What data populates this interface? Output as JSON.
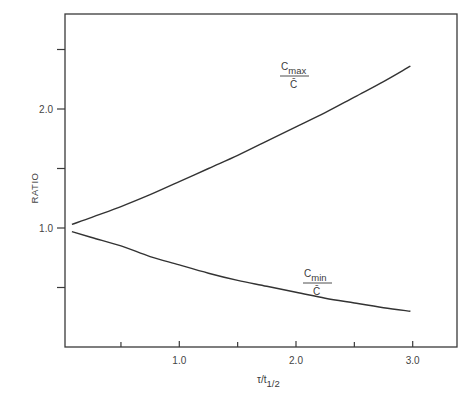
{
  "chart_data": {
    "type": "line",
    "title": "",
    "xlabel": "τ/t1/2",
    "xlabel_main": "τ/t",
    "xlabel_sub": "1/2",
    "ylabel": "RATIO",
    "xlim": [
      0,
      3.4
    ],
    "ylim": [
      0,
      2.8
    ],
    "x_ticks": [
      0.5,
      1.0,
      1.5,
      2.0,
      2.5,
      3.0
    ],
    "x_tick_labels": {
      "1.0": "1.0",
      "2.0": "2.0",
      "3.0": "3.0"
    },
    "y_ticks": [
      0.5,
      1.0,
      1.5,
      2.0,
      2.5
    ],
    "y_tick_labels": {
      "1.0": "1.0",
      "2.0": "2.0"
    },
    "grid": false,
    "legend": "inline curve labels",
    "x": [
      0.08,
      0.25,
      0.5,
      0.75,
      1.0,
      1.25,
      1.5,
      1.75,
      2.0,
      2.25,
      2.5,
      2.75,
      2.98
    ],
    "series": [
      {
        "name": "Cmax/C̄",
        "label_main": "C",
        "label_sub": "max",
        "label_den": "C̄",
        "values": [
          1.03,
          1.09,
          1.18,
          1.28,
          1.39,
          1.5,
          1.61,
          1.73,
          1.85,
          1.97,
          2.1,
          2.23,
          2.36
        ]
      },
      {
        "name": "Cmin/C̄",
        "label_main": "C",
        "label_sub": "min",
        "label_den": "C̄",
        "values": [
          0.97,
          0.92,
          0.85,
          0.76,
          0.69,
          0.62,
          0.56,
          0.51,
          0.46,
          0.41,
          0.37,
          0.33,
          0.3
        ]
      }
    ],
    "annotations": [
      {
        "text": "Cmax/C̄",
        "x": 2.05,
        "y": 2.25
      },
      {
        "text": "Cmin/C̄",
        "x": 2.3,
        "y": 0.62
      }
    ]
  }
}
